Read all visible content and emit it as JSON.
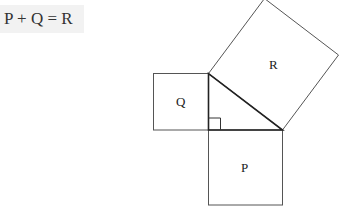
{
  "equation": "P + Q = R",
  "squares": {
    "P": {
      "label": "P"
    },
    "Q": {
      "label": "Q"
    },
    "R": {
      "label": "R"
    }
  },
  "triangle": {
    "right_angle_marked": true
  },
  "colors": {
    "stroke": "#555555",
    "triangle_stroke": "#222222",
    "equation_bg": "#f2f2f2"
  }
}
